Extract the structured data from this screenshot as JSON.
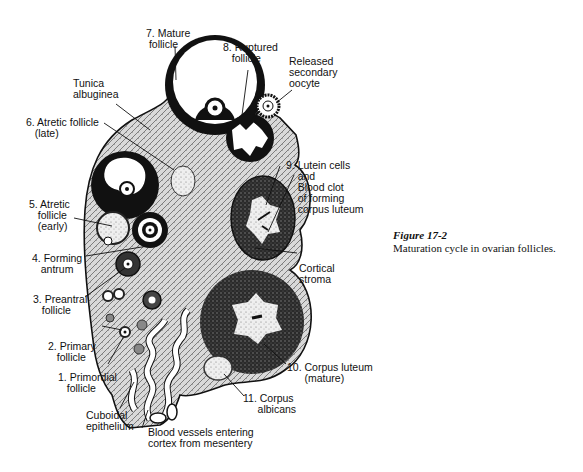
{
  "figure": {
    "number": "Figure 17-2",
    "caption": "Maturation cycle in ovarian follicles."
  },
  "labels": {
    "mature_follicle": "7. Mature\n follicle",
    "ruptured_follicle": "8. Ruptured\n   follicle",
    "released_oocyte": "Released\nsecondary\noocyte",
    "tunica_albuginea": "Tunica\nalbuginea",
    "atretic_late": "6. Atretic follicle\n   (late)",
    "lutein_cells": "9. Lutein cells\n    and\n    Blood clot\n    of forming\n    corpus luteum",
    "atretic_early": "5. Atretic\n   follicle\n   (early)",
    "forming_antrum": "4. Forming\n   antrum",
    "cortical_stroma": "Cortical\nstroma",
    "preantral_follicle": "3. Preantral\n   follicle",
    "primary_follicle": "2. Primary\n   follicle",
    "primordial_follicle": "1. Primordial\n   follicle",
    "corpus_luteum_mature": "10. Corpus luteum\n      (mature)",
    "corpus_albicans": "11. Corpus\n     albicans",
    "cuboidal_epithelium": "Cuboidal\nepithelium",
    "blood_vessels": "Blood vessels entering\ncortex from mesentery"
  },
  "colors": {
    "ink": "#111111",
    "stroma": "#bdbdbd",
    "dark_granulosa": "#1a1a1a",
    "luteum": "#333333",
    "background": "#ffffff"
  }
}
